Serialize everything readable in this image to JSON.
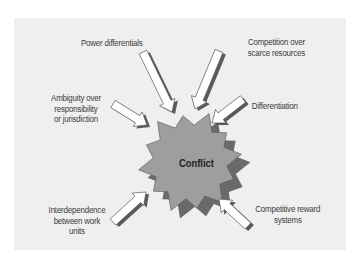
{
  "diagram": {
    "center": {
      "label": "Conflict"
    },
    "sources": [
      {
        "id": "power",
        "label_lines": [
          "Power differentials"
        ]
      },
      {
        "id": "competition",
        "label_lines": [
          "Competition over",
          "scarce resources"
        ]
      },
      {
        "id": "ambiguity",
        "label_lines": [
          "Ambiguity over",
          "responsibility",
          "or jurisdiction"
        ]
      },
      {
        "id": "differentiation",
        "label_lines": [
          "Differentiation"
        ]
      },
      {
        "id": "interdependence",
        "label_lines": [
          "Interdependence",
          "between work",
          "units"
        ]
      },
      {
        "id": "reward",
        "label_lines": [
          "Competitive reward",
          "systems"
        ]
      }
    ],
    "colors": {
      "panel": "#efefef",
      "burst_fill": "#9e9e9e",
      "burst_shadow": "#6a6a6a",
      "arrow_fill": "#ffffff",
      "arrow_shadow": "#5a5a5a",
      "outline": "#555555",
      "text": "#3a3a3a"
    }
  }
}
